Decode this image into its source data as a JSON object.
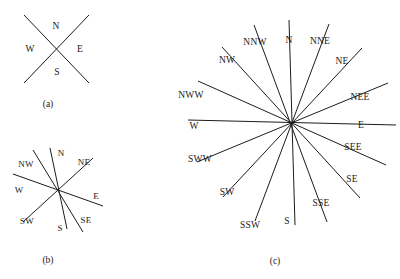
{
  "figure": {
    "background_color": "#ffffff",
    "line_color": "#1c1c1c",
    "text_color": "#1a1a1a",
    "width": 400,
    "height": 279
  },
  "panels": [
    {
      "id": "a",
      "caption": "(a)",
      "caption_x": 48,
      "caption_y": 105,
      "center_x": 56,
      "center_y": 48,
      "radius": 34,
      "stroke_width": 1.0,
      "directions": 4,
      "description": "Four-point compass rose drawn as two crossing lines",
      "labels": [
        {
          "text": "N",
          "x": 56,
          "y": 27,
          "angle_deg": 90
        },
        {
          "text": "E",
          "x": 80,
          "y": 50,
          "angle_deg": 0
        },
        {
          "text": "S",
          "x": 57,
          "y": 73,
          "angle_deg": 270
        },
        {
          "text": "W",
          "x": 30,
          "y": 50,
          "angle_deg": 180
        }
      ],
      "lines": [
        {
          "x1": 24,
          "y1": 15,
          "x2": 89,
          "y2": 83
        },
        {
          "x1": 89,
          "y1": 15,
          "x2": 24,
          "y2": 83
        }
      ]
    },
    {
      "id": "b",
      "caption": "(b)",
      "caption_x": 48,
      "caption_y": 261,
      "center_x": 58,
      "center_y": 188,
      "radius": 42,
      "stroke_width": 1.0,
      "directions": 8,
      "description": "Eight-point compass rose drawn as four crossing lines",
      "labels": [
        {
          "text": "N",
          "x": 61,
          "y": 153,
          "angle_deg": 90
        },
        {
          "text": "NE",
          "x": 84,
          "y": 162,
          "angle_deg": 45
        },
        {
          "text": "E",
          "x": 96,
          "y": 196,
          "angle_deg": 0
        },
        {
          "text": "SE",
          "x": 86,
          "y": 220,
          "angle_deg": 315
        },
        {
          "text": "S",
          "x": 60,
          "y": 228,
          "angle_deg": 270
        },
        {
          "text": "SW",
          "x": 27,
          "y": 221,
          "angle_deg": 225
        },
        {
          "text": "W",
          "x": 19,
          "y": 190,
          "angle_deg": 180
        },
        {
          "text": "NW",
          "x": 26,
          "y": 164,
          "angle_deg": 135
        }
      ],
      "lines": [
        {
          "x1": 50,
          "y1": 148,
          "x2": 67,
          "y2": 229
        },
        {
          "x1": 93,
          "y1": 158,
          "x2": 23,
          "y2": 222
        },
        {
          "x1": 103,
          "y1": 206,
          "x2": 13,
          "y2": 174
        },
        {
          "x1": 83,
          "y1": 232,
          "x2": 33,
          "y2": 150
        }
      ]
    },
    {
      "id": "c",
      "caption": "(c)",
      "caption_x": 275,
      "caption_y": 262,
      "center_x": 292,
      "center_y": 122,
      "radius": 103,
      "stroke_width": 1.0,
      "directions": 16,
      "description": "Sixteen-point compass rose drawn as eight crossing lines",
      "labels": [
        {
          "text": "N",
          "x": 289,
          "y": 41,
          "angle_deg": 90
        },
        {
          "text": "NNE",
          "x": 320,
          "y": 42,
          "angle_deg": 67.5
        },
        {
          "text": "NE",
          "x": 342,
          "y": 62,
          "angle_deg": 45
        },
        {
          "text": "NEE",
          "x": 360,
          "y": 98,
          "angle_deg": 22.5
        },
        {
          "text": "E",
          "x": 361,
          "y": 126,
          "angle_deg": 0
        },
        {
          "text": "SEE",
          "x": 353,
          "y": 148,
          "angle_deg": 337.5
        },
        {
          "text": "SE",
          "x": 352,
          "y": 180,
          "angle_deg": 315
        },
        {
          "text": "SSE",
          "x": 321,
          "y": 204,
          "angle_deg": 292.5
        },
        {
          "text": "S",
          "x": 287,
          "y": 222,
          "angle_deg": 270
        },
        {
          "text": "SSW",
          "x": 250,
          "y": 226,
          "angle_deg": 247.5
        },
        {
          "text": "SW",
          "x": 227,
          "y": 193,
          "angle_deg": 225
        },
        {
          "text": "SWW",
          "x": 200,
          "y": 160,
          "angle_deg": 202.5
        },
        {
          "text": "W",
          "x": 194,
          "y": 127,
          "angle_deg": 180
        },
        {
          "text": "NWW",
          "x": 191,
          "y": 96,
          "angle_deg": 157.5
        },
        {
          "text": "NW",
          "x": 227,
          "y": 61,
          "angle_deg": 135
        },
        {
          "text": "NNW",
          "x": 255,
          "y": 43,
          "angle_deg": 112.5
        }
      ],
      "lines": [
        {
          "x1": 289,
          "y1": 20,
          "x2": 295,
          "y2": 225
        },
        {
          "x1": 329,
          "y1": 24,
          "x2": 255,
          "y2": 221
        },
        {
          "x1": 362,
          "y1": 48,
          "x2": 223,
          "y2": 197
        },
        {
          "x1": 388,
          "y1": 83,
          "x2": 197,
          "y2": 162
        },
        {
          "x1": 396,
          "y1": 125,
          "x2": 188,
          "y2": 120
        },
        {
          "x1": 386,
          "y1": 165,
          "x2": 198,
          "y2": 81
        },
        {
          "x1": 360,
          "y1": 198,
          "x2": 222,
          "y2": 47
        },
        {
          "x1": 327,
          "y1": 222,
          "x2": 254,
          "y2": 25
        }
      ]
    }
  ]
}
